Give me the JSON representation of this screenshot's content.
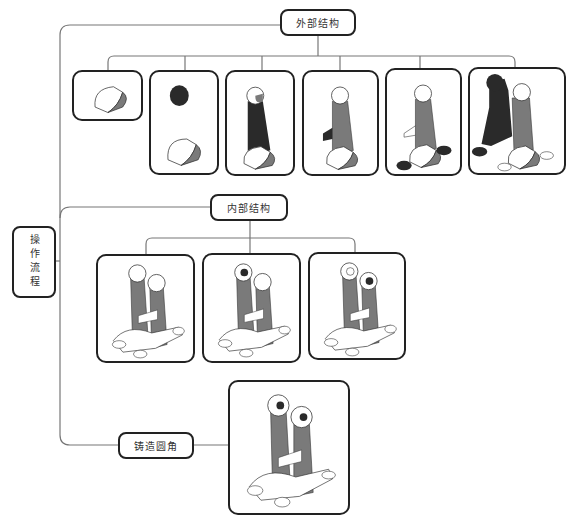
{
  "diagram": {
    "root": {
      "label": "操作流程"
    },
    "branches": [
      {
        "label": "外部结构",
        "steps": [
          {
            "name": "step-1",
            "desc": "half-cylinder base"
          },
          {
            "name": "step-2",
            "desc": "boss cylinder added (dark) above half-cylinder base"
          },
          {
            "name": "step-3",
            "desc": "tapered arm connecting boss to base (dark)"
          },
          {
            "name": "step-4",
            "desc": "rib plate added (dark)"
          },
          {
            "name": "step-5",
            "desc": "mounting lugs added (dark)"
          },
          {
            "name": "step-6",
            "desc": "mirrored second arm (dark)"
          }
        ]
      },
      {
        "label": "内部结构",
        "steps": [
          {
            "name": "step-1",
            "desc": "full bracket, solid bosses"
          },
          {
            "name": "step-2",
            "desc": "bore in left boss"
          },
          {
            "name": "step-3",
            "desc": "bore in right boss"
          }
        ]
      },
      {
        "label": "铸造圆角",
        "steps": [
          {
            "name": "step-1",
            "desc": "bracket with cast fillets"
          }
        ]
      }
    ]
  },
  "colors": {
    "line": "#777777",
    "border": "#222222",
    "shade": "#7a7a7a",
    "dark": "#2a2a2a"
  }
}
